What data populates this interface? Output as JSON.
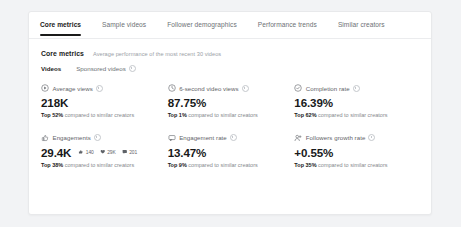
{
  "tabs": [
    {
      "label": "Core metrics",
      "active": true
    },
    {
      "label": "Sample videos",
      "active": false
    },
    {
      "label": "Follower demographics",
      "active": false
    },
    {
      "label": "Performance trends",
      "active": false
    },
    {
      "label": "Similar creators",
      "active": false
    }
  ],
  "section": {
    "title": "Core metrics",
    "subtitle": "Average performance of the most recent 30 videos"
  },
  "subtabs": [
    {
      "label": "Videos",
      "active": true,
      "info": false
    },
    {
      "label": "Sponsored videos",
      "active": false,
      "info": true
    }
  ],
  "metrics": [
    {
      "icon": "play-circle-icon",
      "label": "Average views",
      "value": "218K",
      "note_rank": "Top 52%",
      "note_rest": " compared to similar creators",
      "substats": []
    },
    {
      "icon": "clock-icon",
      "label": "6-second video views",
      "value": "87.75%",
      "note_rank": "Top 1%",
      "note_rest": " compared to similar creators",
      "substats": []
    },
    {
      "icon": "check-circle-icon",
      "label": "Completion rate",
      "value": "16.39%",
      "note_rank": "Top 62%",
      "note_rest": " compared to similar creators",
      "substats": []
    },
    {
      "icon": "thumbs-up-icon",
      "label": "Engagements",
      "value": "29.4K",
      "note_rank": "Top 38%",
      "note_rest": " compared to similar creators",
      "substats": [
        {
          "icon": "like-icon",
          "count": "140"
        },
        {
          "icon": "heart-icon",
          "count": "29K"
        },
        {
          "icon": "comment-icon",
          "count": "201"
        }
      ]
    },
    {
      "icon": "speech-bubble-icon",
      "label": "Engagement rate",
      "value": "13.47%",
      "note_rank": "Top 9%",
      "note_rest": " compared to similar creators",
      "substats": []
    },
    {
      "icon": "follower-icon",
      "label": "Followers growth rate",
      "value": "+0.55%",
      "note_rank": "Top 35%",
      "note_rest": " compared to similar creators",
      "substats": []
    }
  ],
  "colors": {
    "page_background": "#f2f3f5",
    "panel_background": "#ffffff",
    "border": "#e8e9eb",
    "text_primary": "#1a1a1a",
    "text_secondary": "#6d7175",
    "text_muted": "#9aa0a6",
    "active_underline": "#1a1a1a"
  }
}
